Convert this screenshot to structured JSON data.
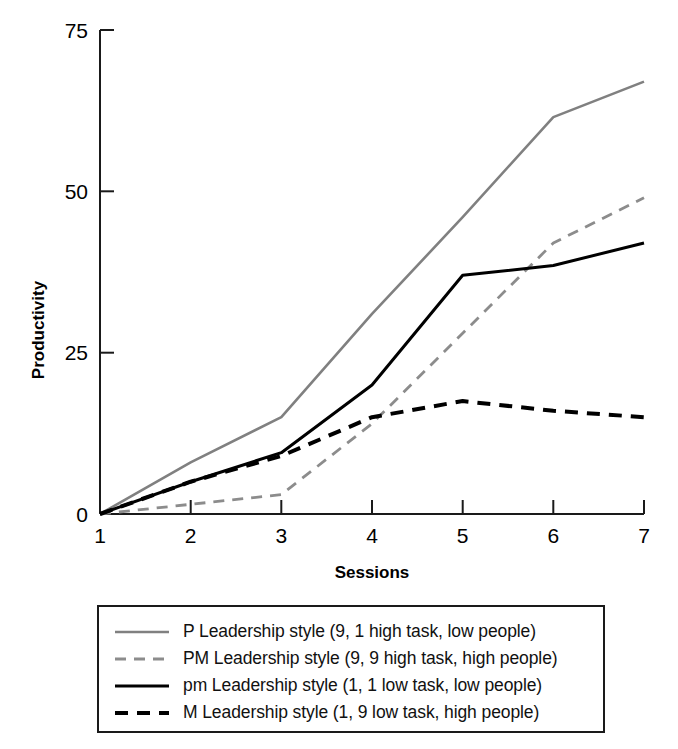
{
  "chart_data": {
    "type": "line",
    "title": "",
    "xlabel": "Sessions",
    "ylabel": "Productivity",
    "x": [
      1,
      2,
      3,
      4,
      5,
      6,
      7
    ],
    "xtick_labels": [
      "1",
      "2",
      "3",
      "4",
      "5",
      "6",
      "7"
    ],
    "ytick_labels": [
      "0",
      "25",
      "50",
      "75"
    ],
    "yticks": [
      0,
      25,
      50,
      75
    ],
    "xlim": [
      1,
      7
    ],
    "ylim": [
      0,
      75
    ],
    "grid": false,
    "legend_position": "below-plot",
    "series": [
      {
        "name": "P Leadership style (9, 1 high task, low people)",
        "key": "P",
        "style": "solid",
        "color": "#808080",
        "width": 2.6,
        "values": [
          0,
          8,
          15,
          31,
          46,
          61.5,
          67
        ]
      },
      {
        "name": "PM Leadership style (9, 9 high task, high people)",
        "key": "PM",
        "style": "dashed",
        "color": "#8c8c8c",
        "width": 2.8,
        "values": [
          0,
          1.5,
          3,
          14,
          28,
          42,
          49
        ]
      },
      {
        "name": "pm Leadership style (1, 1 low task, low people)",
        "key": "pm",
        "style": "solid",
        "color": "#000000",
        "width": 3.0,
        "values": [
          0,
          5,
          9.5,
          20,
          37,
          38.5,
          42
        ]
      },
      {
        "name": "M Leadership style (1, 9 low task, high people)",
        "key": "M",
        "style": "dashed",
        "color": "#000000",
        "width": 4.0,
        "values": [
          0,
          5,
          9,
          15,
          17.5,
          16,
          15
        ]
      }
    ]
  },
  "legend": {
    "items": [
      {
        "label": "P Leadership style (9, 1 high task, low people)",
        "swatch": "solid-gray-line-icon"
      },
      {
        "label": "PM Leadership style (9, 9 high task, high people)",
        "swatch": "dashed-gray-line-icon"
      },
      {
        "label": "pm Leadership style (1, 1 low task, low people)",
        "swatch": "solid-black-line-icon"
      },
      {
        "label": "M Leadership style (1, 9 low task, high people)",
        "swatch": "dashed-black-line-icon"
      }
    ]
  }
}
